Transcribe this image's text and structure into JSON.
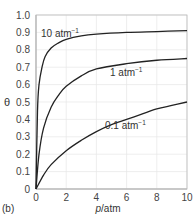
{
  "chart_data": {
    "type": "line",
    "title": "",
    "panel_label": "(b)",
    "xlabel": "p/atm",
    "ylabel": "θ",
    "xlim": [
      0,
      10
    ],
    "ylim": [
      0,
      1.0
    ],
    "grid": true,
    "xticks": [
      "0",
      "2",
      "4",
      "6",
      "8",
      "10"
    ],
    "yticks": [
      "0",
      "0.1",
      "0.2",
      "0.3",
      "0.4",
      "0.5",
      "0.6",
      "0.7",
      "0.8",
      "0.9",
      "1.0"
    ],
    "series": [
      {
        "name": "10 atm⁻¹",
        "label_main": "10 atm",
        "label_sup": "−1",
        "x": [
          0,
          0.1,
          0.2,
          0.4,
          0.6,
          1,
          1.5,
          2,
          3,
          4,
          6,
          8,
          10
        ],
        "y": [
          0,
          0.45,
          0.6,
          0.7,
          0.76,
          0.81,
          0.84,
          0.86,
          0.88,
          0.89,
          0.9,
          0.905,
          0.91
        ]
      },
      {
        "name": "1 atm⁻¹",
        "label_main": "1 atm",
        "label_sup": "−1",
        "x": [
          0,
          0.2,
          0.5,
          1,
          1.5,
          2,
          3,
          4,
          6,
          8,
          10
        ],
        "y": [
          0,
          0.2,
          0.35,
          0.47,
          0.54,
          0.59,
          0.65,
          0.69,
          0.72,
          0.74,
          0.75
        ]
      },
      {
        "name": "0.1 atm⁻¹",
        "label_main": "0.1 atm",
        "label_sup": "−1",
        "x": [
          0,
          0.5,
          1,
          2,
          3,
          4,
          5,
          6,
          7,
          8,
          9,
          10
        ],
        "y": [
          0,
          0.08,
          0.14,
          0.22,
          0.28,
          0.33,
          0.37,
          0.4,
          0.43,
          0.46,
          0.48,
          0.5
        ]
      }
    ]
  }
}
